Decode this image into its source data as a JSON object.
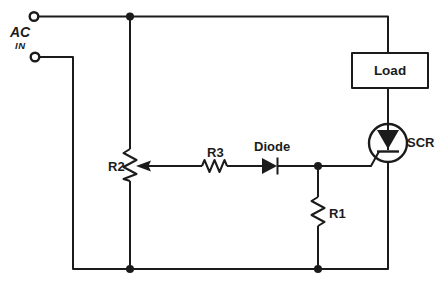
{
  "diagram": {
    "kind": "circuit-schematic",
    "background_color": "#ffffff",
    "line_color": "#1b1b1b",
    "labels": {
      "source": "AC",
      "source_sub": "IN",
      "load": "Load",
      "scr": "SCR",
      "r1": "R1",
      "r2": "R2",
      "r3": "R3",
      "diode": "Diode"
    },
    "components": [
      {
        "label": "AC IN",
        "type": "ac-input-terminals"
      },
      {
        "label": "Load",
        "type": "load-block"
      },
      {
        "label": "SCR",
        "type": "thyristor"
      },
      {
        "label": "R2",
        "type": "potentiometer"
      },
      {
        "label": "R3",
        "type": "resistor"
      },
      {
        "label": "Diode",
        "type": "diode"
      },
      {
        "label": "R1",
        "type": "resistor"
      }
    ]
  }
}
